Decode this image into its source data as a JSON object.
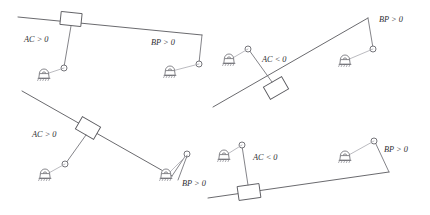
{
  "figure": {
    "stroke_color": "#59595e",
    "link_color": "#6e6e74",
    "background": "#ffffff"
  },
  "labels": {
    "ac_positive": "AC > 0",
    "ac_negative": "AC < 0",
    "bp_positive": "BP > 0"
  },
  "panels": [
    {
      "id": "top-left",
      "beam": {
        "x1": 18,
        "y1": 17,
        "x2": 202,
        "y2": 35
      },
      "block": {
        "cx": 71,
        "cy": 19,
        "w": 21,
        "h": 13,
        "angle": 6
      },
      "ac_label": "AC > 0",
      "ac_label_pos": {
        "x": 24,
        "y": 42
      },
      "bp_label": "BP > 0",
      "bp_label_pos": {
        "x": 151,
        "y": 45
      },
      "left_link": {
        "x1": 71,
        "y1": 26,
        "x2": 64,
        "y2": 67
      },
      "left_node": {
        "cx": 64,
        "cy": 68,
        "r": 3
      },
      "left_support": {
        "cx": 44,
        "cy": 77
      },
      "right_link": {
        "x1": 202,
        "y1": 35,
        "x2": 199,
        "y2": 63
      },
      "right_node": {
        "cx": 199,
        "cy": 64,
        "r": 3
      },
      "right_support": {
        "cx": 170,
        "cy": 74
      }
    },
    {
      "id": "top-right",
      "beam": {
        "x1": 213,
        "y1": 107,
        "x2": 368,
        "y2": 18
      },
      "block": {
        "cx": 276,
        "cy": 88,
        "w": 21,
        "h": 14,
        "angle": -30
      },
      "ac_label": "AC < 0",
      "ac_label_pos": {
        "x": 262,
        "y": 62
      },
      "bp_label": "BP > 0",
      "bp_label_pos": {
        "x": 379,
        "y": 22
      },
      "left_link": {
        "x1": 272,
        "y1": 82,
        "x2": 249,
        "y2": 50
      },
      "left_node": {
        "cx": 248,
        "cy": 49,
        "r": 3
      },
      "left_support": {
        "cx": 229,
        "cy": 62
      },
      "right_link": {
        "x1": 368,
        "y1": 18,
        "x2": 373,
        "y2": 48
      },
      "right_node": {
        "cx": 373,
        "cy": 49,
        "r": 3
      },
      "right_support": {
        "cx": 345,
        "cy": 63
      }
    },
    {
      "id": "bottom-left",
      "beam": {
        "x1": 22,
        "y1": 91,
        "x2": 172,
        "y2": 176
      },
      "block": {
        "cx": 88,
        "cy": 128,
        "w": 21,
        "h": 14,
        "angle": 30
      },
      "ac_label": "AC > 0",
      "ac_label_pos": {
        "x": 32,
        "y": 137
      },
      "bp_label": "BP > 0",
      "bp_label_pos": {
        "x": 182,
        "y": 181
      },
      "left_link": {
        "x1": 86,
        "y1": 135,
        "x2": 66,
        "y2": 163
      },
      "left_node": {
        "cx": 65,
        "cy": 164,
        "r": 3
      },
      "left_support": {
        "cx": 45,
        "cy": 177
      },
      "right_link": {
        "x1": 172,
        "y1": 176,
        "x2": 186,
        "y2": 155
      },
      "right_node": {
        "cx": 187,
        "cy": 154,
        "r": 3
      },
      "right_support": {
        "cx": 166,
        "cy": 177
      },
      "extra_link": {
        "x1": 187,
        "y1": 156,
        "x2": 178,
        "y2": 180
      }
    },
    {
      "id": "bottom-right",
      "beam": {
        "x1": 208,
        "y1": 198,
        "x2": 389,
        "y2": 172
      },
      "block": {
        "cx": 249,
        "cy": 192,
        "w": 22,
        "h": 14,
        "angle": -8
      },
      "ac_label": "AC < 0",
      "ac_label_pos": {
        "x": 253,
        "y": 160
      },
      "bp_label": "BP > 0",
      "bp_label_pos": {
        "x": 384,
        "y": 152
      },
      "left_link": {
        "x1": 248,
        "y1": 185,
        "x2": 242,
        "y2": 146
      },
      "left_node": {
        "cx": 242,
        "cy": 145,
        "r": 3
      },
      "left_support": {
        "cx": 224,
        "cy": 158
      },
      "right_link": {
        "x1": 389,
        "y1": 172,
        "x2": 375,
        "y2": 142
      },
      "right_node": {
        "cx": 374,
        "cy": 141,
        "r": 3
      },
      "right_support": {
        "cx": 345,
        "cy": 159
      }
    }
  ],
  "icons": {
    "support": "ground-bearing-icon",
    "node": "pin-joint-icon",
    "block": "slider-block-icon"
  }
}
